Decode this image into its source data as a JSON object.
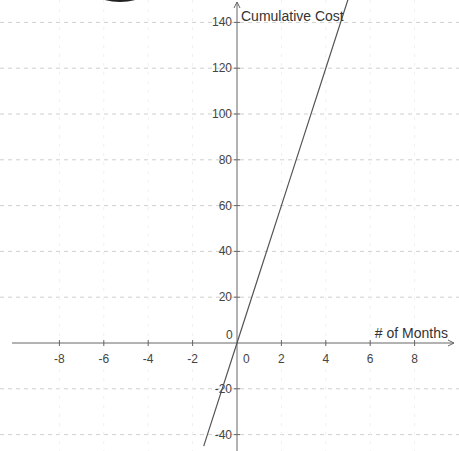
{
  "chart_data": {
    "type": "line",
    "title": "",
    "xlabel": "# of Months",
    "ylabel": "Cumulative Cost",
    "x_ticks": [
      -8,
      -6,
      -4,
      -2,
      0,
      2,
      4,
      6,
      8
    ],
    "y_ticks": [
      -40,
      -20,
      0,
      20,
      40,
      60,
      80,
      100,
      120,
      140
    ],
    "xlim": [
      -10.6,
      9.9
    ],
    "ylim": [
      -47,
      150
    ],
    "grid": true,
    "grid_style": "dashed",
    "legend": null,
    "series": [
      {
        "name": "Cumulative Cost",
        "equation": "y = 30x",
        "x": [
          -1.5,
          0,
          1,
          2,
          3,
          4,
          5
        ],
        "y": [
          -45,
          0,
          30,
          60,
          90,
          120,
          150
        ],
        "color": "#555555"
      }
    ]
  },
  "axes": {
    "x_label": "# of Months",
    "y_label": "Cumulative Cost",
    "x_tick_labels": [
      "-8",
      "-6",
      "-4",
      "-2",
      "0",
      "2",
      "4",
      "6",
      "8"
    ],
    "y_tick_labels": [
      "-40",
      "-20",
      "20",
      "40",
      "60",
      "80",
      "100",
      "120",
      "140"
    ],
    "origin_label": "0"
  },
  "colors": {
    "axis": "#666666",
    "grid": "#cfcfcf",
    "line": "#555555",
    "text": "#444444"
  }
}
